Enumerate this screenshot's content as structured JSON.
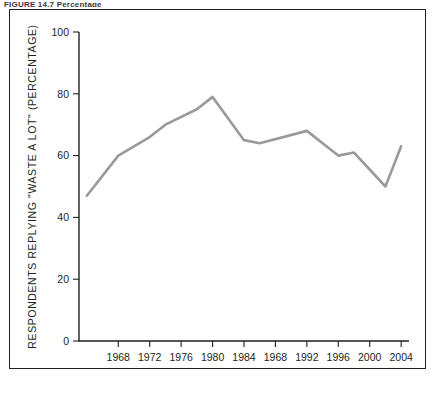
{
  "figure": {
    "top_caption": "FIGURE 14.7   Percentage",
    "line_color": "#9a9a9a",
    "axis_color": "#231f20",
    "frame_color": "#231f20",
    "background": "#ffffff"
  },
  "chart_data": {
    "type": "line",
    "title": "",
    "subtitle": "",
    "xlabel": "YEAR",
    "ylabel": "RESPONDENTS REPLYING \"WASTE A LOT\" (PERCENTAGE)",
    "xlim": [
      1963,
      2005
    ],
    "ylim": [
      0,
      100
    ],
    "grid": false,
    "legend": "none",
    "y_ticks": [
      0,
      20,
      40,
      60,
      80,
      100
    ],
    "y_tick_labels": [
      "0",
      "20",
      "40",
      "60",
      "80",
      "100"
    ],
    "x_ticks": [
      1968,
      1972,
      1976,
      1980,
      1984,
      1988,
      1992,
      1996,
      2000,
      2004
    ],
    "x_tick_labels": [
      "1968",
      "1972",
      "1976",
      "1980",
      "1984",
      "1968",
      "1992",
      "1996",
      "2000",
      "2004"
    ],
    "x": [
      1964,
      1968,
      1970,
      1972,
      1974,
      1978,
      1980,
      1984,
      1986,
      1992,
      1996,
      1998,
      2002,
      2004
    ],
    "values": [
      47,
      60,
      63,
      66,
      70,
      75,
      79,
      65,
      64,
      68,
      60,
      61,
      50,
      63
    ],
    "series": [
      {
        "name": "Respondents replying \"waste a lot\"",
        "color": "#9a9a9a",
        "points": [
          {
            "x": 1964,
            "y": 47
          },
          {
            "x": 1968,
            "y": 60
          },
          {
            "x": 1970,
            "y": 63
          },
          {
            "x": 1972,
            "y": 66
          },
          {
            "x": 1974,
            "y": 70
          },
          {
            "x": 1978,
            "y": 75
          },
          {
            "x": 1980,
            "y": 79
          },
          {
            "x": 1984,
            "y": 65
          },
          {
            "x": 1986,
            "y": 64
          },
          {
            "x": 1992,
            "y": 68
          },
          {
            "x": 1996,
            "y": 60
          },
          {
            "x": 1998,
            "y": 61
          },
          {
            "x": 2002,
            "y": 50
          },
          {
            "x": 2004,
            "y": 63
          }
        ]
      }
    ]
  }
}
